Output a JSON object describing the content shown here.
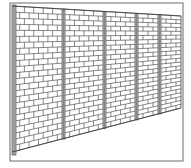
{
  "illustration": {
    "subject": "Brick wall in perspective with vertical support posts",
    "style": "black-and-white line art",
    "colors": {
      "background": "#ffffff",
      "line": "#3a3a3a",
      "post_fill": "#b8b8b8",
      "frame": "#6a6a6a"
    },
    "frame": {
      "left": 10,
      "top": 3,
      "right": 183,
      "bottom": 161
    },
    "wall": {
      "top_left_y": 6,
      "top_right_y": 16,
      "bottom_left_y": 152,
      "bottom_right_y": 108,
      "right_x": 181
    },
    "posts_x": [
      12,
      62,
      103,
      135,
      158
    ],
    "brick_rows": 24
  }
}
